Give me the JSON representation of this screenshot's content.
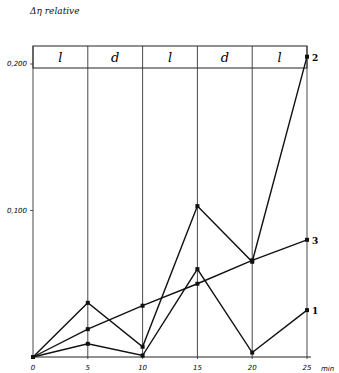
{
  "chart_data": {
    "type": "line",
    "title": "",
    "ylabel": "Δη relative",
    "xlabel": "min",
    "x": [
      0,
      5,
      10,
      15,
      20,
      25
    ],
    "xticks": [
      "0",
      "5",
      "10",
      "15",
      "20",
      "25"
    ],
    "yticks": [
      "0,100",
      "0,200"
    ],
    "ylim": [
      0,
      0.21
    ],
    "xlim": [
      0,
      25
    ],
    "grid": "vertical lines at each x tick",
    "phase_bands": [
      "l",
      "d",
      "l",
      "d",
      "l"
    ],
    "series": [
      {
        "name": "1",
        "values": [
          0.0,
          0.009,
          0.001,
          0.06,
          0.003,
          0.032
        ]
      },
      {
        "name": "2",
        "values": [
          0.0,
          0.037,
          0.007,
          0.103,
          0.065,
          0.205
        ]
      },
      {
        "name": "3",
        "values": [
          0.0,
          0.019,
          0.035,
          0.05,
          0.066,
          0.08
        ]
      }
    ]
  }
}
